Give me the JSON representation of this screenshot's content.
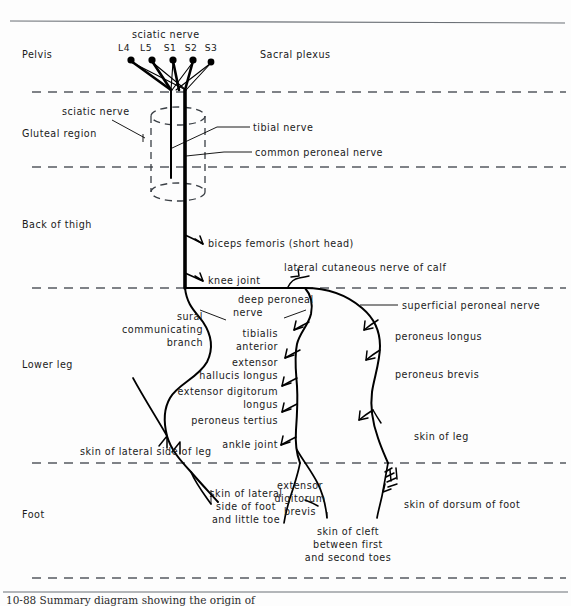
{
  "figure": {
    "title_text": "sciatic nerve",
    "plexus_label": "Sacral plexus",
    "caption": "10-88 Summary diagram showing the origin of"
  },
  "nerve_roots": {
    "labels": [
      "L4",
      "L5",
      "S1",
      "S2",
      "S3"
    ]
  },
  "regions": [
    {
      "key": "pelvis",
      "label": "Pelvis"
    },
    {
      "key": "gluteal",
      "label": "Gluteal region"
    },
    {
      "key": "thigh",
      "label": "Back of thigh"
    },
    {
      "key": "lower_leg",
      "label": "Lower leg"
    },
    {
      "key": "foot",
      "label": "Foot"
    }
  ],
  "labels": {
    "sciatic_nerve_top": "sciatic nerve",
    "sciatic_nerve_gluteal": "sciatic nerve",
    "tibial_nerve": "tibial nerve",
    "common_peroneal_nerve": "common peroneal nerve",
    "biceps_femoris": "biceps femoris (short head)",
    "knee_joint": "knee joint",
    "lateral_cutaneous_calf": "lateral cutaneous nerve of calf",
    "deep_peroneal_nerve_l1": "deep peroneal",
    "deep_peroneal_nerve_l2": "nerve",
    "superficial_peroneal_nerve": "superficial peroneal nerve",
    "sural_l1": "sural",
    "sural_l2": "communicating",
    "sural_l3": "branch",
    "tibialis_anterior_l1": "tibialis",
    "tibialis_anterior_l2": "anterior",
    "ext_hallucis_l1": "extensor",
    "ext_hallucis_l2": "hallucis longus",
    "ext_dig_longus_l1": "extensor digitorum",
    "ext_dig_longus_l2": "longus",
    "peroneus_tertius": "peroneus tertius",
    "ankle_joint": "ankle joint",
    "peroneus_longus": "peroneus longus",
    "peroneus_brevis": "peroneus brevis",
    "skin_of_leg": "skin of leg",
    "skin_lateral_side_leg": "skin of lateral side of leg",
    "skin_lateral_foot_l1": "skin of lateral",
    "skin_lateral_foot_l2": "side of foot",
    "skin_lateral_foot_l3": "and little toe",
    "ext_dig_brevis_l1": "extensor",
    "ext_dig_brevis_l2": "digitorum",
    "ext_dig_brevis_l3": "brevis",
    "skin_cleft_l1": "skin of cleft",
    "skin_cleft_l2": "between first",
    "skin_cleft_l3": "and second toes",
    "skin_dorsum_foot": "skin of dorsum of foot"
  },
  "colors": {
    "ink": "#000000",
    "divider": "#555a60",
    "background": "#fdfdfd"
  }
}
